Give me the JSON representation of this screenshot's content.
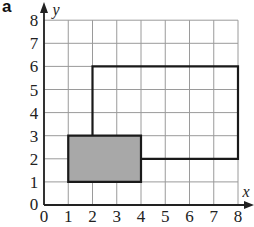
{
  "panel_label": "a",
  "axes": {
    "x_label": "x",
    "y_label": "y",
    "x_ticks": [
      "0",
      "1",
      "2",
      "3",
      "4",
      "5",
      "6",
      "7",
      "8"
    ],
    "y_ticks": [
      "0",
      "1",
      "2",
      "3",
      "4",
      "5",
      "6",
      "7",
      "8"
    ],
    "x_range": [
      0,
      8
    ],
    "y_range": [
      0,
      8
    ],
    "grid": true
  },
  "shapes": [
    {
      "name": "shaded-rectangle",
      "fill": "#a8a8a8",
      "vertices": [
        [
          1,
          1
        ],
        [
          4,
          1
        ],
        [
          4,
          3
        ],
        [
          1,
          3
        ]
      ]
    },
    {
      "name": "large-rectangle-outline",
      "fill": "none",
      "vertices": [
        [
          2,
          3
        ],
        [
          2,
          6
        ],
        [
          8,
          6
        ],
        [
          8,
          2
        ],
        [
          4,
          2
        ]
      ]
    }
  ],
  "colors": {
    "grid": "#9a9a9a",
    "axis": "#222222",
    "outline": "#1a1a1a"
  }
}
